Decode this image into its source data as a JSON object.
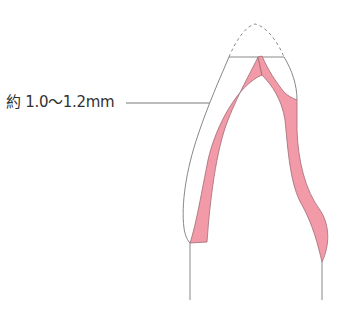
{
  "diagram": {
    "annotation": {
      "label": "約 1.0〜1.2mm"
    },
    "colors": {
      "outline": "#8a8a8a",
      "pink_fill": "#f29aa8",
      "pink_edge": "#a06a74",
      "text": "#333333"
    }
  }
}
